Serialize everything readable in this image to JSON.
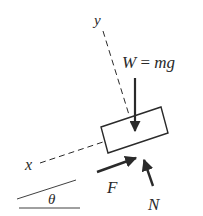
{
  "diagram": {
    "type": "free-body-diagram",
    "colors": {
      "stroke": "#2a2a2a",
      "background": "#ffffff"
    },
    "labels": {
      "y_axis": "y",
      "x_axis": "x",
      "weight_var": "W",
      "weight_eq": "=",
      "weight_expr": "mg",
      "friction": "F",
      "normal": "N",
      "angle": "θ"
    },
    "forces": [
      {
        "name": "W",
        "description": "weight, vertical downward"
      },
      {
        "name": "F",
        "description": "friction, along incline (up-slope)"
      },
      {
        "name": "N",
        "description": "normal force, perpendicular to incline"
      }
    ]
  }
}
